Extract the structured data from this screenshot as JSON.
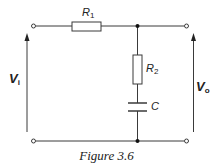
{
  "figure": {
    "caption": "Figure 3.6",
    "type": "RC low-pass circuit schematic"
  },
  "components": {
    "r1": {
      "symbol": "R",
      "subscript": "1",
      "kind": "resistor",
      "orientation": "horizontal"
    },
    "r2": {
      "symbol": "R",
      "subscript": "2",
      "kind": "resistor",
      "orientation": "vertical"
    },
    "c": {
      "symbol": "C",
      "kind": "capacitor",
      "orientation": "horizontal-plates"
    }
  },
  "voltages": {
    "input": {
      "symbol": "V",
      "subscript": "i",
      "direction": "up"
    },
    "output": {
      "symbol": "V",
      "subscript": "o",
      "direction": "up"
    }
  },
  "terminals": [
    "input-top",
    "input-bottom",
    "output-top",
    "output-bottom"
  ],
  "nodes": [
    "top-junction",
    "bottom-junction"
  ],
  "colors": {
    "line": "#3a3a3a",
    "node": "#111111",
    "background": "#ffffff"
  }
}
